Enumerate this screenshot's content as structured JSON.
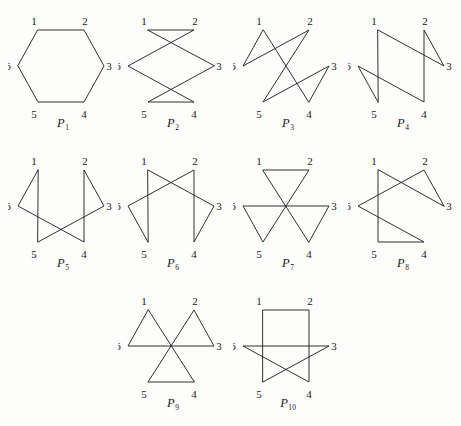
{
  "figure": {
    "background_color": "#fdfdfc",
    "line_color": "#1a1a1a",
    "vertex_labels": [
      "1",
      "2",
      "3",
      "4",
      "5",
      "6"
    ],
    "vertex_positions": {
      "1": {
        "x": 30,
        "y": 22
      },
      "2": {
        "x": 76,
        "y": 22
      },
      "3": {
        "x": 96,
        "y": 58
      },
      "4": {
        "x": 76,
        "y": 94
      },
      "5": {
        "x": 30,
        "y": 94
      },
      "6": {
        "x": 10,
        "y": 58
      }
    },
    "label_offsets": {
      "1": {
        "x": -4,
        "y": -5
      },
      "2": {
        "x": 1,
        "y": -5
      },
      "3": {
        "x": 5,
        "y": 4
      },
      "4": {
        "x": 0,
        "y": 16
      },
      "5": {
        "x": -4,
        "y": 16
      },
      "6": {
        "x": -10,
        "y": 4
      }
    },
    "panels": [
      {
        "caption_base": "P",
        "caption_sub": "1",
        "caption_full": "P1",
        "cycle": [
          1,
          2,
          3,
          4,
          5,
          6
        ],
        "layout": {
          "row": 0,
          "col": 0
        }
      },
      {
        "caption_base": "P",
        "caption_sub": "2",
        "caption_full": "P2",
        "cycle": [
          1,
          2,
          6,
          4,
          5,
          3
        ],
        "layout": {
          "row": 0,
          "col": 1
        }
      },
      {
        "caption_base": "P",
        "caption_sub": "3",
        "caption_full": "P3",
        "cycle": [
          1,
          6,
          2,
          5,
          3,
          4
        ],
        "layout": {
          "row": 0,
          "col": 2
        }
      },
      {
        "caption_base": "P",
        "caption_sub": "4",
        "caption_full": "P4",
        "cycle": [
          1,
          3,
          2,
          4,
          6,
          5
        ],
        "layout": {
          "row": 0,
          "col": 3
        }
      },
      {
        "caption_base": "P",
        "caption_sub": "5",
        "caption_full": "P5",
        "cycle": [
          1,
          6,
          4,
          2,
          3,
          5
        ],
        "layout": {
          "row": 1,
          "col": 0
        }
      },
      {
        "caption_base": "P",
        "caption_sub": "6",
        "caption_full": "P6",
        "cycle": [
          1,
          3,
          4,
          2,
          6,
          5
        ],
        "layout": {
          "row": 1,
          "col": 1
        }
      },
      {
        "caption_base": "P",
        "caption_sub": "7",
        "caption_full": "P7",
        "cycle": [
          1,
          2,
          5,
          6,
          3,
          4
        ],
        "layout": {
          "row": 1,
          "col": 2
        }
      },
      {
        "caption_base": "P",
        "caption_sub": "8",
        "caption_full": "P8",
        "cycle": [
          1,
          5,
          4,
          6,
          2,
          3
        ],
        "layout": {
          "row": 1,
          "col": 3
        }
      },
      {
        "caption_base": "P",
        "caption_sub": "9",
        "caption_full": "P9",
        "cycle": [
          1,
          6,
          3,
          2,
          5,
          4
        ],
        "layout": {
          "row": 2,
          "col": 1
        }
      },
      {
        "caption_base": "P",
        "caption_sub": "10",
        "caption_full": "P10",
        "cycle": [
          1,
          2,
          4,
          6,
          3,
          5
        ],
        "layout": {
          "row": 2,
          "col": 2
        }
      }
    ],
    "grid": {
      "col_x": [
        8,
        118,
        233,
        348
      ],
      "row_y": [
        8,
        148,
        288
      ]
    }
  }
}
